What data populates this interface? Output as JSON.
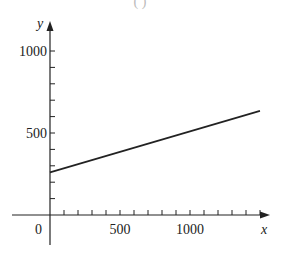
{
  "caption_partial": "( )",
  "chart_data": {
    "type": "line",
    "title": "",
    "xlabel": "x",
    "ylabel": "y",
    "xlim": [
      -250,
      1600
    ],
    "ylim": [
      -100,
      1100
    ],
    "x_ticks": [
      100,
      200,
      300,
      400,
      500,
      600,
      700,
      800,
      900,
      1000,
      1100,
      1200,
      1300,
      1400,
      1500
    ],
    "x_tick_labels": [
      "500",
      "1000"
    ],
    "y_ticks": [
      100,
      200,
      300,
      400,
      500,
      600,
      700,
      800,
      900,
      1000
    ],
    "y_tick_labels": [
      "500",
      "1000"
    ],
    "origin_label": "0",
    "grid": false,
    "legend": null,
    "series": [
      {
        "name": "line",
        "x": [
          0,
          1500
        ],
        "y": [
          260,
          635
        ],
        "color": "#222222"
      }
    ]
  }
}
